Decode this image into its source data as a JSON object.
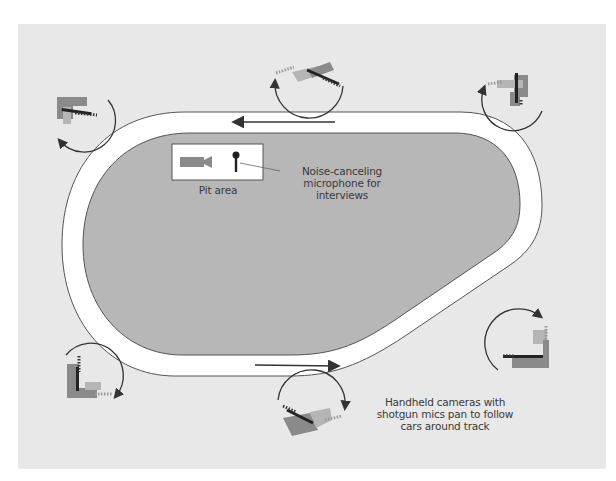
{
  "diagram": {
    "type": "race-track-camera-placement",
    "colors": {
      "background": "#e8e8e8",
      "infield": "#b7b7b7",
      "track": "#ffffff",
      "outline": "#555555",
      "arrow": "#333333",
      "camera_dark": "#222222",
      "camera_mid": "#8a8a8a",
      "camera_light": "#b5b5b5"
    },
    "labels": {
      "pit_area": "Pit area",
      "microphone": "Noise-canceling microphone for interviews",
      "cameras": "Handheld cameras with shotgun mics pan to follow cars around track"
    },
    "pit_area": {
      "items": [
        "camera-icon",
        "microphone-icon"
      ]
    },
    "track_direction": "counter-clockwise",
    "direction_arrows": [
      {
        "position": "top-straight",
        "direction": "left"
      },
      {
        "position": "bottom-straight",
        "direction": "right"
      }
    ],
    "camera_positions": [
      {
        "id": "top-left",
        "pan": "counter-clockwise"
      },
      {
        "id": "top-center",
        "pan": "counter-clockwise"
      },
      {
        "id": "top-right",
        "pan": "counter-clockwise"
      },
      {
        "id": "bottom-right",
        "pan": "clockwise"
      },
      {
        "id": "bottom-center",
        "pan": "clockwise"
      },
      {
        "id": "bottom-left",
        "pan": "clockwise"
      }
    ]
  }
}
